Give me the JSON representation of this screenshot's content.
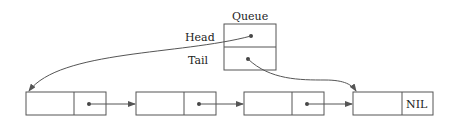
{
  "queue": {
    "title": "Queue",
    "fields": [
      {
        "label": "Head",
        "points_to": "node-1"
      },
      {
        "label": "Tail",
        "points_to": "node-4"
      }
    ]
  },
  "list": {
    "nodes": [
      {
        "value": "",
        "next": "node-2"
      },
      {
        "value": "",
        "next": "node-3"
      },
      {
        "value": "",
        "next": "node-4"
      },
      {
        "value": "",
        "next": "NIL"
      }
    ],
    "nil_label": "NIL"
  },
  "colors": {
    "stroke": "#555555",
    "text": "#222222",
    "background": "#ffffff"
  }
}
